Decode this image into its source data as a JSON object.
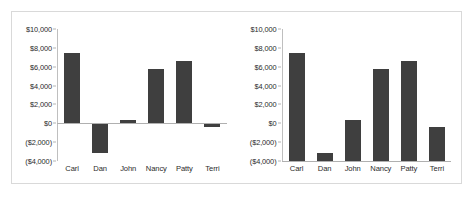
{
  "figure": {
    "background_color": "#ffffff",
    "border_color": "#d9d9d9",
    "bar_color": "#3f3f3f",
    "axis_color": "#b0b0b0"
  },
  "chart_data": [
    {
      "type": "bar",
      "title": "",
      "subtitle": "",
      "xlabel": "",
      "ylabel": "",
      "categories": [
        "Carl",
        "Dan",
        "John",
        "Nancy",
        "Patty",
        "Terri"
      ],
      "values": [
        7500,
        -3100,
        400,
        5800,
        6600,
        -400
      ],
      "ylim": [
        -4000,
        10000
      ],
      "yticks": [
        -4000,
        -2000,
        0,
        2000,
        4000,
        6000,
        8000,
        10000
      ],
      "ytick_labels": [
        "($4,000)",
        "($2,000)",
        "$0",
        "$2,000",
        "$4,000",
        "$6,000",
        "$8,000",
        "$10,000"
      ],
      "bar_baseline": 0,
      "grid": false,
      "legend": false,
      "legend_position": "none",
      "annotation": "Bars drawn from the $0 value axis; negative values extend below zero."
    },
    {
      "type": "bar",
      "title": "",
      "subtitle": "",
      "xlabel": "",
      "ylabel": "",
      "categories": [
        "Carl",
        "Dan",
        "John",
        "Nancy",
        "Patty",
        "Terri"
      ],
      "values": [
        7500,
        -3100,
        400,
        5800,
        6600,
        -400
      ],
      "ylim": [
        -4000,
        10000
      ],
      "yticks": [
        -4000,
        -2000,
        0,
        2000,
        4000,
        6000,
        8000,
        10000
      ],
      "ytick_labels": [
        "($4,000)",
        "($2,000)",
        "$0",
        "$2,000",
        "$4,000",
        "$6,000",
        "$8,000",
        "$10,000"
      ],
      "bar_baseline": -4000,
      "grid": false,
      "legend": false,
      "legend_position": "none",
      "annotation": "Bars drawn from the bottom of the axis at ($4,000) rather than from zero."
    }
  ]
}
